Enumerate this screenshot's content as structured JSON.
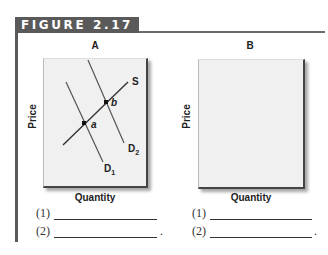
{
  "figure": {
    "title": "FIGURE 2.17",
    "header_color": "#5a5a5a"
  },
  "panels": [
    {
      "label": "A",
      "x_axis": "Quantity",
      "y_axis": "Price",
      "curves": [
        {
          "name": "S",
          "label": "S",
          "type": "supply"
        },
        {
          "name": "D1",
          "label": "D",
          "subscript": "1",
          "type": "demand"
        },
        {
          "name": "D2",
          "label": "D",
          "subscript": "2",
          "type": "demand"
        }
      ],
      "points": [
        {
          "label": "a",
          "on": [
            "S",
            "D1"
          ]
        },
        {
          "label": "b",
          "on": [
            "S",
            "D2"
          ]
        }
      ],
      "answers": [
        {
          "label": "(1)",
          "value": ""
        },
        {
          "label": "(2)",
          "value": "",
          "end": "."
        }
      ]
    },
    {
      "label": "B",
      "x_axis": "Quantity",
      "y_axis": "Price",
      "curves": [
        {
          "name": "S1",
          "label": "S",
          "subscript": "1",
          "type": "supply"
        },
        {
          "name": "S2",
          "label": "S",
          "subscript": "2",
          "type": "supply"
        },
        {
          "name": "D",
          "label": "D",
          "type": "demand"
        }
      ],
      "points": [
        {
          "label": "a",
          "on": [
            "S1",
            "D"
          ]
        },
        {
          "label": "b",
          "on": [
            "S2",
            "D"
          ]
        }
      ],
      "answers": [
        {
          "label": "(1)",
          "value": ""
        },
        {
          "label": "(2)",
          "value": "",
          "end": "."
        }
      ]
    }
  ]
}
